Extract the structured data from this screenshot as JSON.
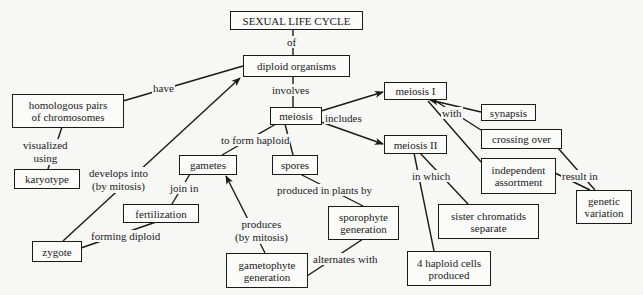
{
  "diagram": {
    "title": "SEXUAL LIFE CYCLE",
    "nodes": {
      "sexual_life_cycle": "SEXUAL LIFE CYCLE",
      "diploid_organisms": "diploid organisms",
      "homologous_pairs_l1": "homologous pairs",
      "homologous_pairs_l2": "of chromosomes",
      "meiosis": "meiosis",
      "meiosis_i": "meiosis I",
      "meiosis_ii": "meiosis II",
      "synapsis": "synapsis",
      "crossing_over": "crossing over",
      "karyotype": "karyotype",
      "gametes": "gametes",
      "spores": "spores",
      "independent_assortment_l1": "independent",
      "independent_assortment_l2": "assortment",
      "genetic_variation_l1": "genetic",
      "genetic_variation_l2": "variation",
      "fertilization": "fertilization",
      "sister_chromatids_l1": "sister chromatids",
      "sister_chromatids_l2": "separate",
      "sporophyte_l1": "sporophyte",
      "sporophyte_l2": "generation",
      "zygote": "zygote",
      "gametophyte_l1": "gametophyte",
      "gametophyte_l2": "generation",
      "haploid_cells_l1": "4 haploid cells",
      "haploid_cells_l2": "produced"
    },
    "links": {
      "of": "of",
      "involves": "involves",
      "have": "have",
      "includes": "includes",
      "with": "with",
      "visualized_l1": "visualized",
      "visualized_l2": "using",
      "to_form_haploid": "to form haploid",
      "develops_l1": "develops into",
      "develops_l2": "(by mitosis)",
      "join_in": "join in",
      "produced_in_plants_by": "produced in plants by",
      "in_which": "in which",
      "result_in": "result in",
      "produces_l1": "produces",
      "produces_l2": "(by mitosis)",
      "forming_diploid": "forming diploid",
      "alternates_with": "alternates with"
    },
    "colors": {
      "line": "#1a1a1a",
      "background": "#f7f7f5"
    }
  }
}
